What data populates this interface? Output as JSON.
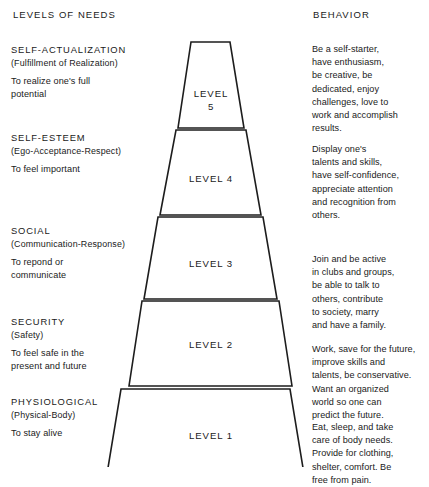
{
  "headers": {
    "left": "LEVELS OF NEEDS",
    "right": "BEHAVIOR"
  },
  "needs": [
    {
      "title": "SELF-ACTUALIZATION",
      "subtitle": "(Fulfillment of Realization)",
      "description": "To realize one's full\npotential"
    },
    {
      "title": "SELF-ESTEEM",
      "subtitle": "(Ego-Acceptance-Respect)",
      "description": "To feel important"
    },
    {
      "title": "SOCIAL",
      "subtitle": "(Communication-Response)",
      "description": "To repond or\ncommunicate"
    },
    {
      "title": "SECURITY",
      "subtitle": "(Safety)",
      "description": "To feel safe in the\npresent and future"
    },
    {
      "title": "PHYSIOLOGICAL",
      "subtitle": "(Physical-Body)",
      "description": "To stay alive"
    }
  ],
  "behaviors": [
    "Be a self-starter,\nhave enthusiasm,\nbe creative, be\ndedicated, enjoy\nchallenges, love to\nwork and accomplish\nresults.",
    "Display one's\ntalents and skills,\nhave self-confidence,\nappreciate attention\nand recognition from\nothers.",
    "Join and be active\nin clubs and groups,\nbe able to talk to\nothers, contribute\nto society, marry\nand have a family.",
    "Work, save for the future,\nimprove skills and\ntalents, be conservative.\nWant an organized\nworld so one can\npredict the future.",
    "Eat, sleep, and take\ncare of body needs.\nProvide for clothing,\nshelter, comfort. Be\nfree from pain."
  ],
  "pyramid": {
    "tiers": [
      {
        "label": "LEVEL\n5",
        "level_number": "5"
      },
      {
        "label": "LEVEL 4",
        "level_number": "4"
      },
      {
        "label": "LEVEL 3",
        "level_number": "3"
      },
      {
        "label": "LEVEL 2",
        "level_number": "2"
      },
      {
        "label": "LEVEL 1",
        "level_number": "1"
      }
    ],
    "stroke_color": "#1d1d1d",
    "fill_color": "#ffffff"
  }
}
